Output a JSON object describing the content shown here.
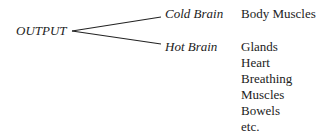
{
  "root": {
    "label": "OUTPUT"
  },
  "branches": [
    {
      "label": "Cold Brain",
      "items": [
        "Body Muscles"
      ]
    },
    {
      "label": "Hot Brain",
      "items": [
        "Glands",
        "Heart",
        "Breathing",
        "Muscles",
        "Bowels",
        "etc."
      ]
    }
  ]
}
